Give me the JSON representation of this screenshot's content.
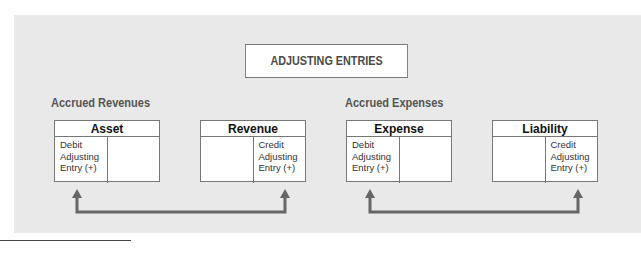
{
  "title": "ADJUSTING ENTRIES",
  "groups": [
    {
      "label": "Accrued Revenues"
    },
    {
      "label": "Accrued Expenses"
    }
  ],
  "accounts": [
    {
      "name": "Asset",
      "left": "Debit Adjusting Entry (+)",
      "right": ""
    },
    {
      "name": "Revenue",
      "left": "",
      "right": "Credit Adjusting Entry (+)"
    },
    {
      "name": "Expense",
      "left": "Debit Adjusting Entry (+)",
      "right": ""
    },
    {
      "name": "Liability",
      "left": "",
      "right": "Credit Adjusting Entry (+)"
    }
  ],
  "entry_lines": {
    "line1": "Debit",
    "line2": "Adjusting",
    "line3": "Entry (+)",
    "credit_line1": "Credit"
  },
  "colors": {
    "arrow": "#666666",
    "panel": "#e9e9e9",
    "border": "#777777"
  }
}
